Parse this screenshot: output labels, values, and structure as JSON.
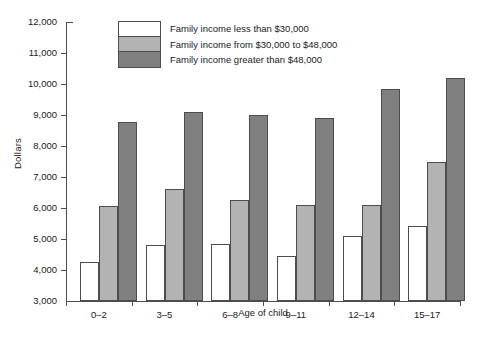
{
  "chart_data": {
    "type": "bar",
    "title": "",
    "xlabel": "Age of child",
    "ylabel": "Dollars",
    "categories": [
      "0–2",
      "3–5",
      "6–8",
      "9–11",
      "12–14",
      "15–17"
    ],
    "series": [
      {
        "name": "Family income less than $30,000",
        "color": "#ffffff",
        "values": [
          4250,
          4800,
          4830,
          4450,
          5100,
          5420
        ]
      },
      {
        "name": "Family income from $30,000 to $48,000",
        "color": "#b3b3b3",
        "values": [
          6070,
          6600,
          6250,
          6100,
          6100,
          7480
        ]
      },
      {
        "name": "Family income greater than $48,000",
        "color": "#808080",
        "values": [
          8780,
          9100,
          9000,
          8890,
          9840,
          10200
        ]
      }
    ],
    "ylim": [
      3000,
      12000
    ],
    "ytick_labels": [
      "12,000",
      "11,000",
      "10,000",
      "9,000",
      "8,000",
      "7,000",
      "6,000",
      "5,000",
      "4,000",
      "3,000"
    ],
    "ytick_values": [
      12000,
      11000,
      10000,
      9000,
      8000,
      7000,
      6000,
      5000,
      4000,
      3000
    ],
    "grid": false,
    "legend_position": "top-center",
    "axis_color": "#4d4d4d",
    "bar_border_color": "#4d4d4d",
    "background": "#ffffff"
  }
}
